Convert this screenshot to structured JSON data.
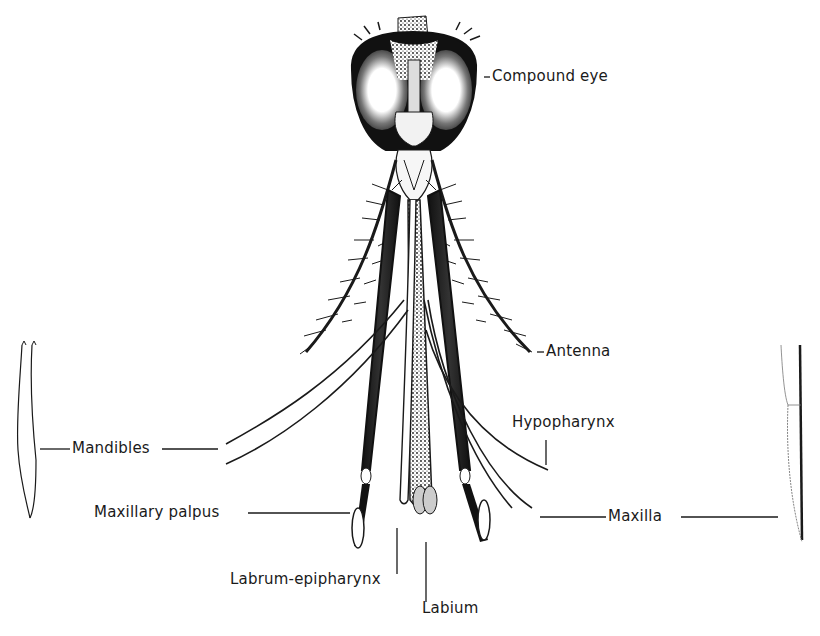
{
  "figure": {
    "ink_color": "#1a1a1a",
    "background": "#ffffff"
  },
  "labels": {
    "compound_eye": "Compound eye",
    "antenna": "Antenna",
    "mandibles": "Mandibles",
    "hypopharynx": "Hypopharynx",
    "maxillary_palpus": "Maxillary palpus",
    "maxilla": "Maxilla",
    "labrum_epipharynx": "Labrum-epipharynx",
    "labium": "Labium"
  },
  "insets": {
    "left": "mandible-detail",
    "right": "maxilla-detail"
  }
}
